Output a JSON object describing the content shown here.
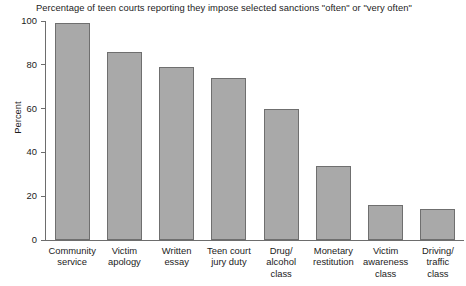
{
  "chart_data": {
    "type": "bar",
    "title": "Percentage of teen courts reporting they impose selected sanctions \"often\" or \"very often\"",
    "xlabel": "",
    "ylabel": "Percent",
    "ylim": [
      0,
      100
    ],
    "yticks": [
      0,
      20,
      40,
      60,
      80,
      100
    ],
    "ytick_labels": [
      "0",
      "20",
      "40",
      "60",
      "80",
      "100"
    ],
    "grid": false,
    "legend": null,
    "bar_color": "#a9a9a9",
    "bar_edge_color": "#6f6f6f",
    "categories": [
      "Community\nservice",
      "Victim\napology",
      "Written\nessay",
      "Teen court\njury duty",
      "Drug/\nalcohol\nclass",
      "Monetary\nrestitution",
      "Victim\nawareness\nclass",
      "Driving/\ntraffic\nclass"
    ],
    "values": [
      99,
      86,
      79,
      74,
      60,
      34,
      16,
      14
    ]
  }
}
